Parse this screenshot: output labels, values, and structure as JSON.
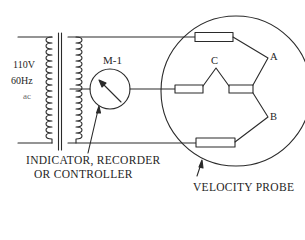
{
  "diagram": {
    "colors": {
      "line": "#2a2a2a",
      "text": "#1e1e1e",
      "background": "#ffffff"
    },
    "source": {
      "voltage": "110V",
      "frequency": "60Hz",
      "type": "ac"
    },
    "meter": {
      "label": "M-1",
      "caption_line1": "INDICATOR, RECORDER",
      "caption_line2": "OR CONTROLLER"
    },
    "probe": {
      "caption": "VELOCITY PROBE",
      "points": {
        "a": "A",
        "b": "B",
        "c": "C"
      }
    }
  }
}
